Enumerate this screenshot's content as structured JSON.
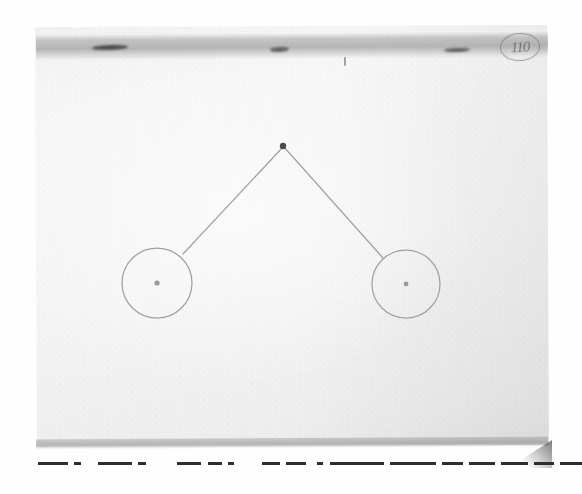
{
  "scene": {
    "kind": "photograph-of-paper",
    "subject": "faint pencil line drawing on a sheet of light paper",
    "paper_color": "#f7f7f7",
    "background_color": "#ffffff",
    "pencil_color": "#9a9a9a",
    "ink_color": "#2e2e2e",
    "shadow_color": "#6e6e6e"
  },
  "annotations": {
    "circled_mark_text": "110",
    "circled_mark_note": "handwritten circled mark at top-right of sheet"
  },
  "drawing": {
    "title": "pencil schematic",
    "apex": {
      "label": "apex-dot",
      "x": 283,
      "y": 146,
      "r": 3.2
    },
    "circles": [
      {
        "label": "left-circle",
        "cx": 157,
        "cy": 283,
        "r": 35,
        "center_dot_r": 2.6
      },
      {
        "label": "right-circle",
        "cx": 406,
        "cy": 284,
        "r": 34,
        "center_dot_r": 2.4
      }
    ],
    "lines": [
      {
        "label": "left-leg",
        "x1": 283,
        "y1": 147,
        "x2": 183,
        "y2": 254
      },
      {
        "label": "right-leg",
        "x1": 284,
        "y1": 147,
        "x2": 383,
        "y2": 258
      }
    ]
  },
  "top_band": {
    "label": "shadow-band",
    "smudges": [
      {
        "label": "smudge-left"
      },
      {
        "label": "smudge-center"
      },
      {
        "label": "smudge-right"
      },
      {
        "label": "smudge-tick"
      }
    ]
  },
  "dashes": {
    "label": "dashed-rule",
    "segments": [
      {
        "x": 38,
        "w": 30
      },
      {
        "x": 74,
        "w": 7
      },
      {
        "x": 98,
        "w": 34
      },
      {
        "x": 138,
        "w": 8
      },
      {
        "x": 177,
        "w": 24
      },
      {
        "x": 208,
        "w": 14
      },
      {
        "x": 228,
        "w": 6
      },
      {
        "x": 262,
        "w": 18
      },
      {
        "x": 286,
        "w": 20
      },
      {
        "x": 317,
        "w": 6
      },
      {
        "x": 330,
        "w": 54
      },
      {
        "x": 390,
        "w": 46
      },
      {
        "x": 442,
        "w": 21
      },
      {
        "x": 469,
        "w": 26
      },
      {
        "x": 501,
        "w": 27
      },
      {
        "x": 534,
        "w": 20
      },
      {
        "x": 560,
        "w": 40
      },
      {
        "x": 606,
        "w": 19
      },
      {
        "x": 631,
        "w": 27
      }
    ]
  }
}
